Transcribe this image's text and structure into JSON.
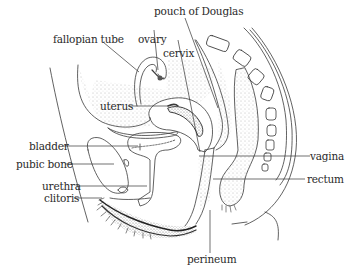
{
  "diagram": {
    "type": "anatomical sagittal section",
    "labels": {
      "pouch_of_douglas": "pouch of Douglas",
      "fallopian_tube": "fallopian tube",
      "ovary": "ovary",
      "cervix": "cervix",
      "uterus": "uterus",
      "bladder": "bladder",
      "pubic_bone": "pubic bone",
      "urethra": "urethra",
      "clitoris": "clitoris",
      "vagina": "vagina",
      "rectum": "rectum",
      "perineum": "perineum"
    },
    "colors": {
      "line": "#3a3a3a",
      "stipple": "#8a8a8a",
      "background": "#ffffff"
    }
  }
}
